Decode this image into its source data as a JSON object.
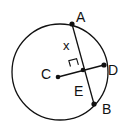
{
  "diagram": {
    "type": "circle-geometry",
    "stroke_color": "#111111",
    "background": "#ffffff",
    "circle": {
      "center_x": 60,
      "center_y": 72,
      "radius": 48
    },
    "points": {
      "A": {
        "label": "A",
        "x": 72,
        "y": 24
      },
      "B": {
        "label": "B",
        "x": 94,
        "y": 104
      },
      "C": {
        "label": "C",
        "x": 58,
        "y": 77
      },
      "D": {
        "label": "D",
        "x": 104,
        "y": 65
      },
      "E": {
        "label": "E",
        "x": 83,
        "y": 70
      }
    },
    "segments": [
      {
        "from": "A",
        "to": "B",
        "name": "chord-AB"
      },
      {
        "from": "C",
        "to": "D",
        "name": "segment-CD"
      }
    ],
    "annotations": {
      "x_label": "x",
      "right_angle_at": "E"
    }
  }
}
